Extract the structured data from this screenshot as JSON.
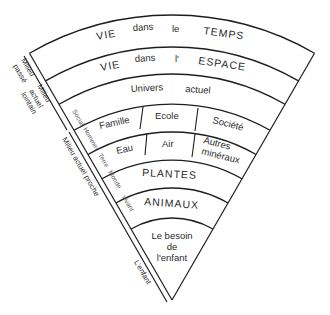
{
  "diagram": {
    "type": "fan-sector",
    "bands": [
      {
        "id": "temps",
        "words": [
          "VIE",
          "dans",
          "le",
          "TEMPS"
        ]
      },
      {
        "id": "espace",
        "words": [
          "VIE",
          "dans",
          "l'",
          "ESPACE"
        ]
      },
      {
        "id": "univers",
        "words": [
          "Univers",
          "actuel"
        ]
      },
      {
        "id": "social",
        "cells": [
          "Famille",
          "Ecole",
          "Société"
        ]
      },
      {
        "id": "terre",
        "cells": [
          "Eau",
          "Air",
          "Autres",
          "minéraux"
        ]
      },
      {
        "id": "plantes",
        "label": "PLANTES"
      },
      {
        "id": "animaux",
        "label": "ANIMAUX"
      },
      {
        "id": "enfant",
        "lines": [
          "Le besoin",
          "de",
          "l'enfant"
        ]
      }
    ],
    "inner_strip_labels": [
      "Social",
      "Hommes",
      "Terre",
      "Monde",
      "vivant"
    ],
    "side_labels": {
      "milieu_passe": [
        "Milieu",
        "passé"
      ],
      "milieu_lointain": [
        "Milieu",
        "actuel",
        "lointain"
      ],
      "milieu_proche": "Milieu actuel proche",
      "enfant": "L'enfant"
    }
  }
}
